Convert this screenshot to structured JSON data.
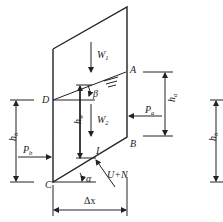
{
  "figure": {
    "type": "slice force diagram",
    "points": {
      "A": "A",
      "B": "B",
      "C": "C",
      "D": "D",
      "I": "I"
    },
    "forces": {
      "W1": {
        "base": "W",
        "sub": "1"
      },
      "W2": {
        "base": "W",
        "sub": "2"
      },
      "Pa": {
        "base": "P",
        "sub": "a"
      },
      "Pb": {
        "base": "P",
        "sub": "b"
      },
      "UN": "U+N"
    },
    "dimensions": {
      "ha": {
        "base": "h",
        "sub": "a"
      },
      "hb": {
        "base": "h",
        "sub": "b"
      },
      "hw": {
        "base": "h",
        "sub": "w"
      },
      "hb_right": {
        "base": "h",
        "sub": "b"
      },
      "dx": "Δx"
    },
    "angles": {
      "alpha": "α",
      "beta": "β"
    }
  }
}
